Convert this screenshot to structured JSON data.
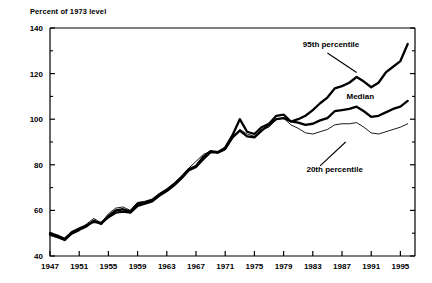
{
  "chart_data": {
    "type": "line",
    "title": "Percent of 1973 level",
    "xlabel": "",
    "ylabel": "Percent of 1973 level",
    "xlim": [
      1947,
      1997
    ],
    "ylim": [
      40,
      140
    ],
    "grid": false,
    "legend_position": "inline-annotations",
    "y_ticks": [
      "40",
      "60",
      "80",
      "100",
      "120",
      "140"
    ],
    "y_tick_values": [
      40,
      60,
      80,
      100,
      120,
      140
    ],
    "y_minor_tick_values": [
      50,
      70,
      90,
      110,
      130
    ],
    "x_ticks": [
      "1947",
      "1951",
      "1955",
      "1959",
      "1963",
      "1967",
      "1971",
      "1975",
      "1979",
      "1983",
      "1987",
      "1991",
      "1995"
    ],
    "x_tick_values": [
      1947,
      1951,
      1955,
      1959,
      1963,
      1967,
      1971,
      1975,
      1979,
      1983,
      1987,
      1991,
      1995
    ],
    "annotations": [
      {
        "text": "95th percentile",
        "x": 1985.5,
        "y": 131.5
      },
      {
        "text": "Median",
        "x": 1989.5,
        "y": 109.0
      },
      {
        "text": "20th percentile",
        "x": 1986.0,
        "y": 77.0
      }
    ],
    "x": [
      1947,
      1948,
      1949,
      1950,
      1951,
      1952,
      1953,
      1954,
      1955,
      1956,
      1957,
      1958,
      1959,
      1960,
      1961,
      1962,
      1963,
      1964,
      1965,
      1966,
      1967,
      1968,
      1969,
      1970,
      1971,
      1972,
      1973,
      1974,
      1975,
      1976,
      1977,
      1978,
      1979,
      1980,
      1981,
      1982,
      1983,
      1984,
      1985,
      1986,
      1987,
      1988,
      1989,
      1990,
      1991,
      1992,
      1993,
      1994,
      1995,
      1996
    ],
    "series": [
      {
        "name": "95th percentile",
        "style": "thick",
        "values": [
          50.0,
          49.0,
          47.5,
          50.5,
          52.0,
          53.5,
          55.0,
          54.5,
          57.0,
          59.0,
          59.5,
          59.0,
          62.0,
          63.0,
          64.0,
          66.5,
          68.5,
          71.0,
          74.0,
          77.5,
          79.0,
          82.5,
          85.5,
          85.5,
          87.0,
          92.0,
          95.0,
          92.5,
          92.0,
          95.0,
          97.5,
          100.0,
          100.5,
          99.0,
          100.0,
          101.5,
          104.0,
          107.0,
          109.5,
          113.5,
          114.5,
          116.0,
          118.5,
          116.5,
          114.0,
          116.0,
          120.5,
          123.0,
          125.5,
          133.0
        ]
      },
      {
        "name": "Median",
        "style": "thick",
        "values": [
          49.5,
          48.5,
          47.0,
          50.0,
          51.5,
          53.0,
          55.5,
          54.0,
          57.5,
          60.0,
          60.5,
          59.5,
          63.0,
          63.5,
          64.5,
          67.0,
          69.0,
          71.5,
          74.5,
          78.0,
          79.5,
          83.5,
          86.0,
          85.5,
          87.5,
          93.0,
          100.0,
          94.5,
          93.5,
          96.5,
          98.0,
          101.5,
          102.0,
          99.0,
          98.5,
          97.5,
          98.0,
          99.5,
          100.5,
          103.5,
          104.0,
          104.5,
          105.5,
          103.5,
          101.0,
          101.5,
          103.0,
          104.5,
          105.5,
          108.0
        ]
      },
      {
        "name": "20th percentile",
        "style": "thin",
        "values": [
          49.0,
          48.0,
          47.0,
          49.5,
          51.0,
          54.0,
          56.5,
          54.5,
          58.5,
          61.0,
          61.5,
          60.0,
          63.5,
          64.0,
          65.0,
          67.5,
          69.5,
          72.0,
          75.0,
          78.5,
          81.5,
          84.5,
          86.0,
          85.0,
          86.5,
          91.5,
          95.5,
          93.5,
          92.5,
          95.5,
          96.5,
          100.0,
          100.5,
          97.5,
          96.0,
          94.0,
          93.5,
          94.5,
          95.5,
          97.5,
          98.0,
          98.0,
          98.5,
          96.5,
          94.0,
          93.5,
          94.5,
          95.5,
          96.5,
          98.0
        ]
      }
    ]
  }
}
